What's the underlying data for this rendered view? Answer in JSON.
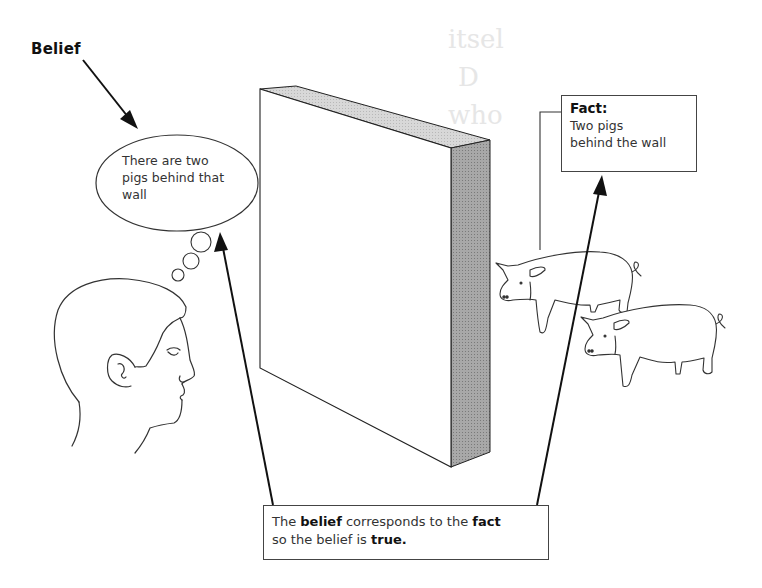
{
  "figure": {
    "belief_label": "Belief",
    "thought_bubble": {
      "lines": [
        "There are two",
        "pigs behind that",
        "wall"
      ]
    },
    "fact_box": {
      "title": "Fact:",
      "lines": [
        "Two pigs",
        "behind the wall"
      ]
    },
    "conclusion_box": {
      "line1_parts": [
        "The ",
        "belief",
        " corresponds to the ",
        "fact"
      ],
      "line2_parts": [
        "so the belief is ",
        "true."
      ]
    },
    "bleed_through_text": [
      "itsel",
      "D",
      "who"
    ],
    "elements": {
      "person": "head-profile",
      "wall": "3d-wall",
      "animals": [
        "pig",
        "pig"
      ],
      "arrows": [
        "belief-label-to-bubble",
        "conclusion-to-bubble",
        "conclusion-to-fact"
      ]
    },
    "colors": {
      "line": "#111111",
      "wall_side": "#9a9a9a",
      "wall_top": "#d4d4d4",
      "background": "#ffffff"
    }
  }
}
